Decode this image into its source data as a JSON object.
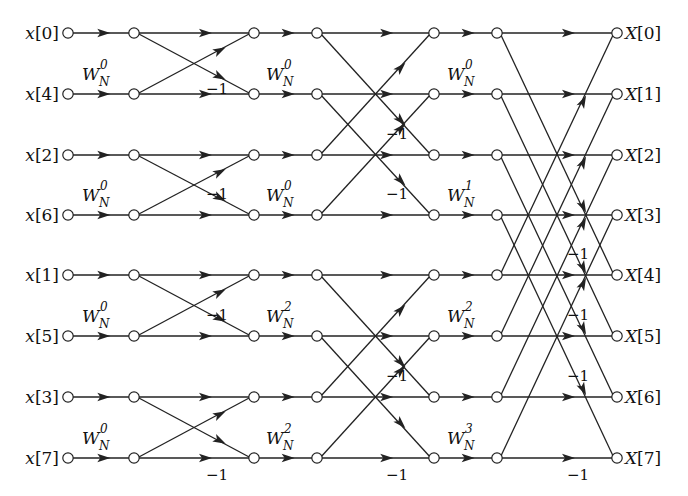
{
  "diagram": {
    "inputs": [
      "x[0]",
      "x[4]",
      "x[2]",
      "x[6]",
      "x[1]",
      "x[5]",
      "x[3]",
      "x[7]"
    ],
    "outputs": [
      "X[0]",
      "X[1]",
      "X[2]",
      "X[3]",
      "X[4]",
      "X[5]",
      "X[6]",
      "X[7]"
    ],
    "rows_y": [
      33,
      94,
      155,
      215,
      275,
      336,
      397,
      458
    ],
    "columns_x": [
      68,
      134,
      254,
      317,
      434,
      497,
      617
    ],
    "twiddle_base": "W",
    "twiddle_subscript": "N",
    "stages": [
      {
        "name": "stage-1",
        "butterfly_span": 1,
        "twiddles": [
          {
            "row": 1,
            "exponent": "0"
          },
          {
            "row": 3,
            "exponent": "0"
          },
          {
            "row": 5,
            "exponent": "0"
          },
          {
            "row": 7,
            "exponent": "0"
          }
        ],
        "negations": [
          {
            "row": 1,
            "label": "−1"
          },
          {
            "row": 3,
            "label": "−1"
          },
          {
            "row": 5,
            "label": "−1"
          },
          {
            "row": 7,
            "label": "−1"
          }
        ]
      },
      {
        "name": "stage-2",
        "butterfly_span": 2,
        "twiddles": [
          {
            "row": 2,
            "exponent": "0"
          },
          {
            "row": 3,
            "exponent": "2"
          },
          {
            "row": 6,
            "exponent": "0"
          },
          {
            "row": 7,
            "exponent": "2"
          }
        ],
        "negations": [
          {
            "row": 2,
            "label": "−1"
          },
          {
            "row": 3,
            "label": "−1"
          },
          {
            "row": 6,
            "label": "−1"
          },
          {
            "row": 7,
            "label": "−1"
          }
        ]
      },
      {
        "name": "stage-3",
        "butterfly_span": 4,
        "twiddles": [
          {
            "row": 4,
            "exponent": "0"
          },
          {
            "row": 5,
            "exponent": "1"
          },
          {
            "row": 6,
            "exponent": "2"
          },
          {
            "row": 7,
            "exponent": "3"
          }
        ],
        "negations": [
          {
            "row": 4,
            "label": "−1"
          },
          {
            "row": 5,
            "label": "−1"
          },
          {
            "row": 6,
            "label": "−1"
          },
          {
            "row": 7,
            "label": "−1"
          }
        ]
      }
    ],
    "visible_twiddle_labels": [
      {
        "stage": 1,
        "row": 1,
        "text": "W",
        "sub": "N",
        "sup": "0"
      },
      {
        "stage": 1,
        "row": 3,
        "text": "W",
        "sub": "N",
        "sup": "0"
      },
      {
        "stage": 1,
        "row": 5,
        "text": "W",
        "sub": "N",
        "sup": "0"
      },
      {
        "stage": 1,
        "row": 7,
        "text": "W",
        "sub": "N",
        "sup": "0"
      },
      {
        "stage": 2,
        "row": 1,
        "text": "W",
        "sub": "N",
        "sup": "0"
      },
      {
        "stage": 2,
        "row": 3,
        "text": "W",
        "sub": "N",
        "sup": "0"
      },
      {
        "stage": 2,
        "row": 5,
        "text": "W",
        "sub": "N",
        "sup": "2"
      },
      {
        "stage": 2,
        "row": 7,
        "text": "W",
        "sub": "N",
        "sup": "2"
      },
      {
        "stage": 3,
        "row": 1,
        "text": "W",
        "sub": "N",
        "sup": "0"
      },
      {
        "stage": 3,
        "row": 3,
        "text": "W",
        "sub": "N",
        "sup": "1"
      },
      {
        "stage": 3,
        "row": 5,
        "text": "W",
        "sub": "N",
        "sup": "2"
      },
      {
        "stage": 3,
        "row": 7,
        "text": "W",
        "sub": "N",
        "sup": "3"
      }
    ],
    "negation_label": "−1"
  }
}
